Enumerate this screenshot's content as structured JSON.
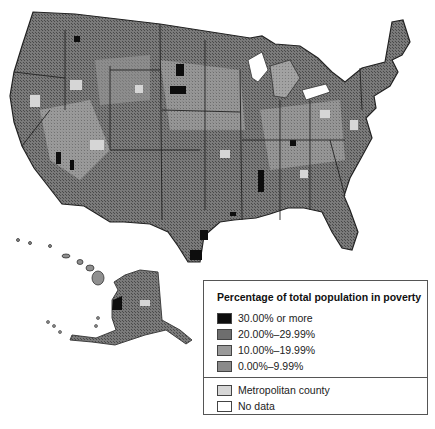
{
  "map": {
    "title": "Percentage of total population in poverty",
    "regions": [
      "Contiguous United States",
      "Alaska",
      "Hawaii"
    ]
  },
  "legend": {
    "title": "Percentage of total population in poverty",
    "items": [
      {
        "label": "30.00% or more",
        "color": "#0d0d0d"
      },
      {
        "label": "20.00%–29.99%",
        "color": "#6e6e6e"
      },
      {
        "label": "10.00%–19.99%",
        "color": "#9a9a9a"
      },
      {
        "label": "0.00%–9.99%",
        "color": "#8a8a8a"
      }
    ],
    "secondary_items": [
      {
        "label": "Metropolitan county",
        "color": "#d6d6d6"
      },
      {
        "label": "No data",
        "color": "#ffffff"
      }
    ]
  },
  "colors": {
    "base_fill": "#8f8f8f",
    "border": "#333333"
  }
}
